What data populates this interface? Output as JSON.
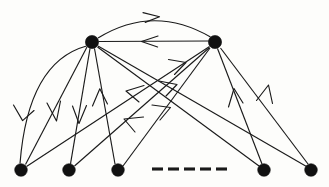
{
  "figure": {
    "background_color": "#fdfdfb",
    "ink_color": "#1a1a1a",
    "node_color": "#111111",
    "node_radius": 6.2,
    "width": 329,
    "height": 187
  },
  "nodes": [
    {
      "id": "top-left",
      "label": "",
      "x": 92,
      "y": 42,
      "r": 6.4
    },
    {
      "id": "top-right",
      "label": "",
      "x": 215,
      "y": 42,
      "r": 6.4
    },
    {
      "id": "bottom-1",
      "label": "",
      "x": 21,
      "y": 170,
      "r": 6.2
    },
    {
      "id": "bottom-2",
      "label": "",
      "x": 69,
      "y": 170,
      "r": 6.2
    },
    {
      "id": "bottom-3",
      "label": "",
      "x": 118,
      "y": 170,
      "r": 6.2
    },
    {
      "id": "bottom-4",
      "label": "",
      "x": 264,
      "y": 170,
      "r": 6.2
    },
    {
      "id": "bottom-5",
      "label": "",
      "x": 311,
      "y": 170,
      "r": 6.2
    }
  ],
  "ellipsis": {
    "label": "",
    "y": 169,
    "x_start": 152,
    "x_end": 228,
    "dash_count": 5,
    "dash_length": 11,
    "gap_length": 5
  },
  "edges": [
    {
      "id": "e-arc-top",
      "from": "top-left",
      "to": "top-right",
      "style": "curved-arc",
      "direction": "left-to-right"
    },
    {
      "id": "e-straight-top",
      "from": "top-right",
      "to": "top-left",
      "style": "straight",
      "direction": "right-to-left"
    },
    {
      "id": "e-arc-left",
      "from": "top-left",
      "to": "bottom-1",
      "style": "curved-arc",
      "direction": "downward"
    },
    {
      "id": "e-b1-tl",
      "from": "bottom-1",
      "to": "top-left",
      "style": "straight",
      "direction": "upward"
    },
    {
      "id": "e-b2-tl",
      "from": "bottom-2",
      "to": "top-left",
      "style": "straight",
      "direction": "upward"
    },
    {
      "id": "e-b3-tl",
      "from": "bottom-3",
      "to": "top-left",
      "style": "straight",
      "direction": "upward"
    },
    {
      "id": "e-b4-tl",
      "from": "bottom-4",
      "to": "top-left",
      "style": "straight",
      "direction": "upward-left"
    },
    {
      "id": "e-b5-tl",
      "from": "bottom-5",
      "to": "top-left",
      "style": "straight",
      "direction": "upward-left"
    },
    {
      "id": "e-b1-tr",
      "from": "bottom-1",
      "to": "top-right",
      "style": "straight",
      "direction": "upward-right"
    },
    {
      "id": "e-b2-tr",
      "from": "bottom-2",
      "to": "top-right",
      "style": "straight",
      "direction": "upward-right"
    },
    {
      "id": "e-b3-tr",
      "from": "bottom-3",
      "to": "top-right",
      "style": "straight",
      "direction": "upward-right"
    },
    {
      "id": "e-b4-tr",
      "from": "bottom-4",
      "to": "top-right",
      "style": "straight",
      "direction": "upward"
    },
    {
      "id": "e-b5-tr",
      "from": "bottom-5",
      "to": "top-right",
      "style": "straight",
      "direction": "upward"
    }
  ]
}
